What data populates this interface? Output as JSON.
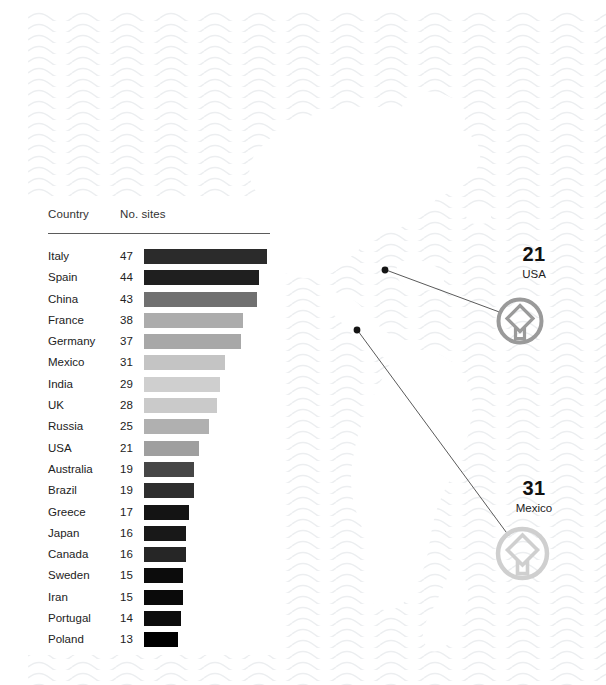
{
  "chart_data": {
    "type": "bar",
    "title": "",
    "xlabel": "",
    "ylabel": "",
    "orientation": "horizontal",
    "columns": [
      "Country",
      "No. sites"
    ],
    "categories": [
      "Italy",
      "Spain",
      "China",
      "France",
      "Germany",
      "Mexico",
      "India",
      "UK",
      "Russia",
      "USA",
      "Australia",
      "Brazil",
      "Greece",
      "Japan",
      "Canada",
      "Sweden",
      "Iran",
      "Portugal",
      "Poland"
    ],
    "values": [
      47,
      44,
      43,
      38,
      37,
      31,
      29,
      28,
      25,
      21,
      19,
      19,
      17,
      16,
      16,
      15,
      15,
      14,
      13
    ],
    "xlim": [
      0,
      47
    ],
    "grid": false,
    "legend": false,
    "bar_colors": [
      "#2b2b2b",
      "#1f1f1f",
      "#707070",
      "#acacac",
      "#a8a8a8",
      "#c4c4c4",
      "#cfcfcf",
      "#cacaca",
      "#b0b0b0",
      "#9f9f9f",
      "#464646",
      "#2e2e2e",
      "#141414",
      "#181818",
      "#262626",
      "#0c0c0c",
      "#0a0a0a",
      "#0d0d0d",
      "#000000"
    ]
  },
  "table": {
    "header": {
      "country": "Country",
      "sites": "No. sites"
    },
    "rows": [
      {
        "country": "Italy",
        "value": "47"
      },
      {
        "country": "Spain",
        "value": "44"
      },
      {
        "country": "China",
        "value": "43"
      },
      {
        "country": "France",
        "value": "38"
      },
      {
        "country": "Germany",
        "value": "37"
      },
      {
        "country": "Mexico",
        "value": "31"
      },
      {
        "country": "India",
        "value": "29"
      },
      {
        "country": "UK",
        "value": "28"
      },
      {
        "country": "Russia",
        "value": "25"
      },
      {
        "country": "USA",
        "value": "21"
      },
      {
        "country": "Australia",
        "value": "19"
      },
      {
        "country": "Brazil",
        "value": "19"
      },
      {
        "country": "Greece",
        "value": "17"
      },
      {
        "country": "Japan",
        "value": "16"
      },
      {
        "country": "Canada",
        "value": "16"
      },
      {
        "country": "Sweden",
        "value": "15"
      },
      {
        "country": "Iran",
        "value": "15"
      },
      {
        "country": "Portugal",
        "value": "14"
      },
      {
        "country": "Poland",
        "value": "13"
      }
    ]
  },
  "callouts": [
    {
      "number": "21",
      "name": "USA",
      "emblem_color": "#9a9a9a",
      "num_x": 489,
      "num_y": 243,
      "name_x": 489,
      "name_y": 268,
      "emblem_cx": 520,
      "emblem_cy": 321,
      "emblem_r": 23,
      "dot_x": 385,
      "dot_y": 270
    },
    {
      "number": "31",
      "name": "Mexico",
      "emblem_color": "#cfcfcf",
      "num_x": 489,
      "num_y": 477,
      "name_x": 489,
      "name_y": 502,
      "emblem_cx": 522,
      "emblem_cy": 553,
      "emblem_r": 27,
      "dot_x": 357,
      "dot_y": 330
    }
  ],
  "colors": {
    "wave": "#eef0f1",
    "background": "#ffffff",
    "rule": "#5b5b5b",
    "text": "#222222",
    "connector": "#5a5a5a"
  }
}
